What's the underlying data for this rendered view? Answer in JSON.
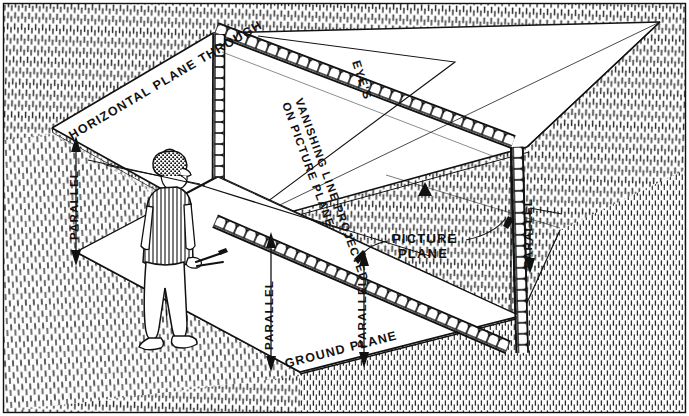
{
  "figure": {
    "kind": "technical-perspective-diagram",
    "medium": "pen-and-ink hatched line drawing",
    "background_color": "#ffffff",
    "ink_color": "#111111",
    "border": {
      "present": true,
      "color": "#111111",
      "width_px": 1
    }
  },
  "labels": {
    "horizontal_plane": "HORIZONTAL PLANE THROUGH",
    "eye": "EYE'S",
    "vanishing_line_1": "VANISHING LINE PROJECTED",
    "vanishing_line_2": "ON PICTURE PLANE",
    "picture_plane_1": "PICTURE",
    "picture_plane_2": "PLANE",
    "ground_plane": "GROUND PLANE",
    "parallel": "PARALLEL"
  },
  "parallel_markers": [
    {
      "id": "parallel-left",
      "text": "PARALLEL",
      "orientation": "vertical",
      "arrow": "down"
    },
    {
      "id": "parallel-center-left",
      "text": "PARALLEL",
      "orientation": "vertical",
      "arrow": "both"
    },
    {
      "id": "parallel-center-right",
      "text": "PARALLEL",
      "orientation": "vertical",
      "arrow": "both"
    },
    {
      "id": "parallel-right",
      "text": "PARALLEL",
      "orientation": "vertical",
      "arrow": "down"
    }
  ],
  "planes": [
    {
      "id": "horizontal-plane",
      "label": "HORIZONTAL PLANE THROUGH",
      "note": "upper horizontal plane at eye level",
      "fill": "#ffffff"
    },
    {
      "id": "picture-plane",
      "label": "PICTURE PLANE",
      "note": "vertical transparent pane with scalloped border",
      "fill": "#ffffff"
    },
    {
      "id": "ground-plane",
      "label": "GROUND PLANE",
      "note": "lower horizontal plane the observer stands on",
      "fill": "#ffffff"
    }
  ],
  "observer": {
    "id": "observer-figure",
    "description": "standing man seen from behind",
    "wears": [
      "flat cap",
      "striped vest",
      "light trousers",
      "shoes"
    ],
    "holds": "rolled drawing / pencils"
  },
  "hatching": {
    "style": "short vertical pen strokes",
    "regions": [
      "background-field",
      "under-horizontal-plane",
      "ground-around-planes"
    ]
  }
}
